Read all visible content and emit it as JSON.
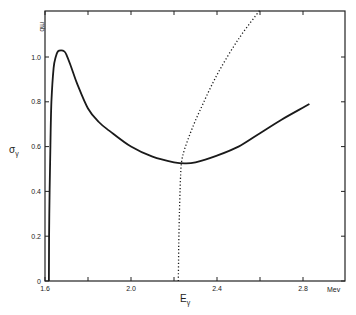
{
  "chart_data": {
    "type": "line",
    "title": "",
    "xlabel": "E",
    "xlabel_subscript": "γ",
    "ylabel": "σ",
    "ylabel_subscript": "γ",
    "x_unit": "Mev",
    "y_unit": "mb",
    "xlim": [
      1.6,
      3.0
    ],
    "ylim": [
      0,
      1.2
    ],
    "x_ticks": [
      1.6,
      1.8,
      2.0,
      2.2,
      2.4,
      2.6,
      2.8
    ],
    "x_tick_labels": [
      "1.6",
      "",
      "2.0",
      "",
      "2.4",
      "",
      "2.8"
    ],
    "y_ticks": [
      0,
      0.2,
      0.4,
      0.6,
      0.8,
      1.0
    ],
    "y_tick_labels": [
      "0",
      "0.2",
      "0.4",
      "0.6",
      "0.8",
      "1.0"
    ],
    "grid": false,
    "legend": null,
    "series": [
      {
        "name": "cross-section (solid)",
        "style": "solid",
        "x": [
          1.618,
          1.62,
          1.625,
          1.63,
          1.64,
          1.65,
          1.66,
          1.675,
          1.69,
          1.7,
          1.72,
          1.75,
          1.8,
          1.85,
          1.9,
          2.0,
          2.1,
          2.2,
          2.25,
          2.3,
          2.4,
          2.5,
          2.6,
          2.7,
          2.83
        ],
        "y": [
          0.0,
          0.3,
          0.6,
          0.8,
          0.95,
          1.0,
          1.025,
          1.03,
          1.025,
          1.01,
          0.96,
          0.88,
          0.77,
          0.71,
          0.67,
          0.6,
          0.555,
          0.53,
          0.525,
          0.53,
          0.56,
          0.6,
          0.66,
          0.72,
          0.79
        ]
      },
      {
        "name": "threshold branch (dotted)",
        "style": "dotted",
        "x": [
          2.22,
          2.222,
          2.225,
          2.23,
          2.235,
          2.25,
          2.28,
          2.32,
          2.4,
          2.5,
          2.6
        ],
        "y": [
          0.0,
          0.15,
          0.3,
          0.45,
          0.53,
          0.59,
          0.67,
          0.76,
          0.92,
          1.08,
          1.21
        ]
      }
    ]
  }
}
